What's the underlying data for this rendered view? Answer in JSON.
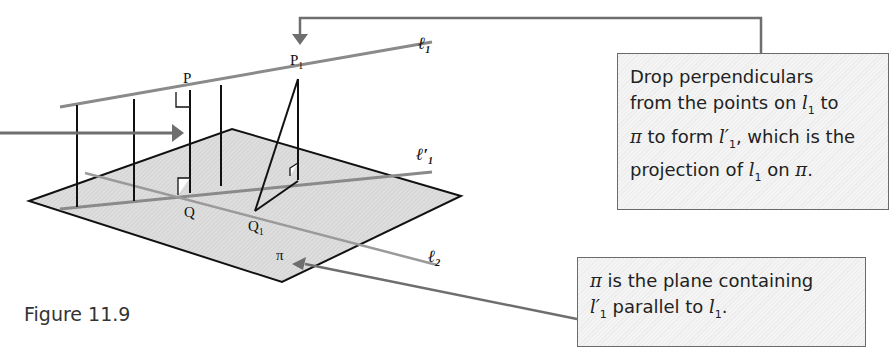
{
  "figure": {
    "caption": "Figure 11.9",
    "labels": {
      "P": "P",
      "P1": "P",
      "P1_sub": "1",
      "Q": "Q",
      "Q1": "Q",
      "Q1_sub": "1",
      "l1": "ℓ",
      "l1_sub": "1",
      "l1_prime": "ℓ′",
      "l1_prime_sub": "1",
      "l2": "ℓ",
      "l2_sub": "2",
      "pi": "π"
    }
  },
  "callouts": {
    "box1": {
      "line1": "Drop perpendiculars",
      "line2_a": "from the points on ",
      "line2_var": "l",
      "line2_sub": "1",
      "line2_b": " to",
      "line3_pi": "π",
      "line3_a": " to form ",
      "line3_var": "l′",
      "line3_sub": "1",
      "line3_b": ", which is the",
      "line4_a": "projection of ",
      "line4_var": "l",
      "line4_sub": "1",
      "line4_b": " on ",
      "line4_pi": "π",
      "line4_c": "."
    },
    "box2": {
      "line1_pi": "π",
      "line1_a": " is the plane containing",
      "line2_var": "l′",
      "line2_sub": "1",
      "line2_a": " parallel to ",
      "line2_var2": "l",
      "line2_sub2": "1",
      "line2_b": "."
    }
  },
  "colors": {
    "plane_fill": "#d9d9d9",
    "line_gray": "#8a8a8a",
    "arrow_gray": "#6e6e6e",
    "black": "#111111"
  }
}
